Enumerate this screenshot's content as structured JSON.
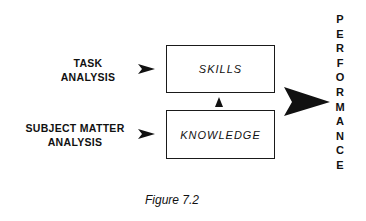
{
  "inputs": [
    {
      "label_lines": [
        "TASK",
        "ANALYSIS"
      ]
    },
    {
      "label_lines": [
        "SUBJECT MATTER",
        "ANALYSIS"
      ]
    }
  ],
  "boxes": {
    "skills": "SKILLS",
    "knowledge": "KNOWLEDGE"
  },
  "output": {
    "letters": [
      "P",
      "E",
      "R",
      "F",
      "O",
      "R",
      "M",
      "A",
      "N",
      "C",
      "E"
    ]
  },
  "caption": "Figure 7.2",
  "icons": {
    "input_arrow": "arrow-right-icon",
    "link_arrow": "arrow-up-icon",
    "output_arrow": "large-arrow-right-icon"
  }
}
